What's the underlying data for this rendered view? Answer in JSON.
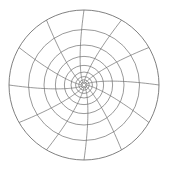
{
  "figure": {
    "background_color": "#ffffff",
    "line_color": "#6e6e6e",
    "outer_line_color": "#5f5f5f",
    "line_width": 0.7
  },
  "chart_data": {
    "type": "line",
    "title": "",
    "subtitle": "",
    "xlabel": "",
    "ylabel": "",
    "grid": true,
    "legend_position": "none",
    "projection": "polar",
    "center": {
      "x": 84,
      "y": 85
    },
    "outer_radius": 75,
    "spoke_count": 12,
    "spoke_angle_step_deg": 30,
    "spoke_angles_deg": [
      0,
      30,
      60,
      90,
      120,
      150,
      180,
      210,
      240,
      270,
      300,
      330
    ],
    "spoke_spiral_twist_deg": 26,
    "ring_count": 9,
    "ring_radii": [
      3.0,
      5.2,
      8.4,
      13.0,
      19.6,
      28.6,
      40.0,
      55.5,
      75.0
    ],
    "ring_radii_normalized": [
      0.04,
      0.069,
      0.112,
      0.173,
      0.261,
      0.381,
      0.533,
      0.74,
      1.0
    ],
    "radial_scale": "logarithmic",
    "tick_labels": [],
    "annotations": [],
    "series": [
      {
        "name": "rings",
        "values": [
          3.0,
          5.2,
          8.4,
          13.0,
          19.6,
          28.6,
          40.0,
          55.5,
          75.0
        ]
      },
      {
        "name": "spokes",
        "values": [
          0,
          30,
          60,
          90,
          120,
          150,
          180,
          210,
          240,
          270,
          300,
          330
        ]
      }
    ]
  }
}
